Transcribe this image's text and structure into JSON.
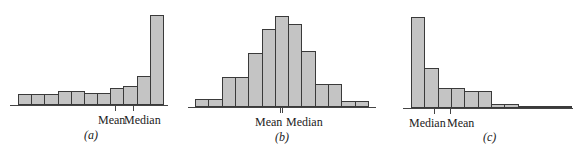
{
  "chart_data": [
    {
      "type": "bar",
      "title": "(a)",
      "caption": "(a)",
      "description": "Left-skewed histogram (skewed to the left): mean less than median",
      "categories": [
        "1",
        "2",
        "3",
        "4",
        "5",
        "6",
        "7",
        "8",
        "9",
        "10",
        "11"
      ],
      "values": [
        11,
        11,
        11,
        14,
        14,
        12,
        12,
        17,
        19,
        29,
        90
      ],
      "xlabel": "",
      "ylabel": "",
      "annotations": [
        {
          "label": "Mean",
          "position_bin": 8.0
        },
        {
          "label": "Median",
          "position_bin": 9.0
        }
      ],
      "grid": false
    },
    {
      "type": "bar",
      "title": "(b)",
      "caption": "(b)",
      "description": "Symmetric histogram: mean approximately equal to median",
      "categories": [
        "1",
        "2",
        "3",
        "4",
        "5",
        "6",
        "7",
        "8",
        "9",
        "10",
        "11",
        "12",
        "13"
      ],
      "values": [
        8,
        8,
        30,
        30,
        54,
        78,
        91,
        83,
        56,
        23,
        23,
        6,
        6
      ],
      "xlabel": "",
      "ylabel": "",
      "annotations": [
        {
          "label": "Mean",
          "position_bin": 6.5
        },
        {
          "label": "Median",
          "position_bin": 6.6
        }
      ],
      "grid": false
    },
    {
      "type": "bar",
      "title": "(c)",
      "caption": "(c)",
      "description": "Right-skewed histogram (skewed to the right): mean greater than median",
      "categories": [
        "1",
        "2",
        "3",
        "4",
        "5",
        "6",
        "7",
        "8",
        "9",
        "10",
        "11",
        "12"
      ],
      "values": [
        91,
        40,
        20,
        20,
        17,
        17,
        4,
        4,
        2,
        2,
        2,
        2
      ],
      "xlabel": "",
      "ylabel": "",
      "annotations": [
        {
          "label": "Median",
          "position_bin": 1.8
        },
        {
          "label": "Mean",
          "position_bin": 2.9
        }
      ],
      "grid": false
    }
  ],
  "panels": {
    "a": {
      "caption": "(a)",
      "mean_label": "Mean",
      "median_label": "Median"
    },
    "b": {
      "caption": "(b)",
      "mean_label": "Mean",
      "median_label": "Median"
    },
    "c": {
      "caption": "(c)",
      "mean_label": "Mean",
      "median_label": "Median"
    }
  }
}
